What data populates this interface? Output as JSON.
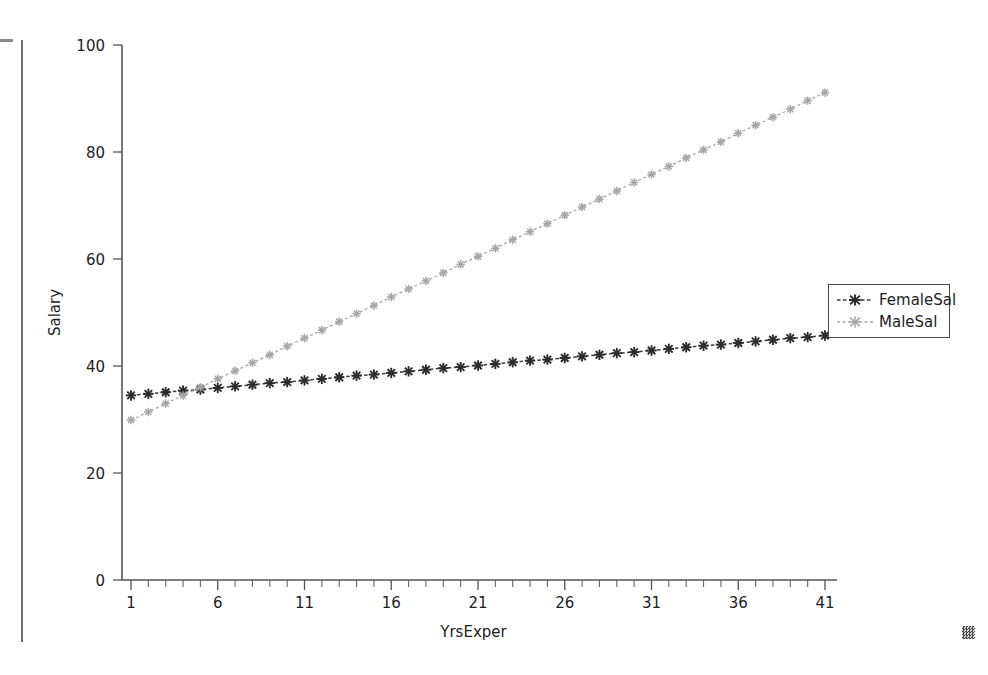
{
  "artifacts": {
    "left_rule": "vertical-scan-line",
    "top_dash": "scan-dash",
    "corner_mark": "scan-speck"
  },
  "chart_data": {
    "type": "line",
    "title": "",
    "xlabel": "YrsExper",
    "ylabel": "Salary",
    "xlim": [
      0,
      42
    ],
    "ylim": [
      0,
      100
    ],
    "xticks": [
      1,
      6,
      11,
      16,
      21,
      26,
      31,
      36,
      41
    ],
    "xtick_labels": [
      "1",
      "6",
      "11",
      "16",
      "21",
      "26",
      "31",
      "36",
      "41"
    ],
    "yticks": [
      0,
      20,
      40,
      60,
      80,
      100
    ],
    "ytick_labels": [
      "0",
      "20",
      "40",
      "60",
      "80",
      "100"
    ],
    "x_minor_step": 1,
    "grid": false,
    "legend_position": "right-center",
    "x": [
      1,
      2,
      3,
      4,
      5,
      6,
      7,
      8,
      9,
      10,
      11,
      12,
      13,
      14,
      15,
      16,
      17,
      18,
      19,
      20,
      21,
      22,
      23,
      24,
      25,
      26,
      27,
      28,
      29,
      30,
      31,
      32,
      33,
      34,
      35,
      36,
      37,
      38,
      39,
      40,
      41
    ],
    "series": [
      {
        "name": "FemaleSal",
        "color": "#2b2b2b",
        "marker": "asterisk",
        "linestyle": "dashed",
        "values": [
          34.5,
          34.8,
          35.1,
          35.4,
          35.6,
          35.9,
          36.2,
          36.5,
          36.8,
          37.0,
          37.3,
          37.6,
          37.9,
          38.2,
          38.4,
          38.7,
          39.0,
          39.3,
          39.6,
          39.8,
          40.1,
          40.4,
          40.7,
          41.0,
          41.2,
          41.5,
          41.8,
          42.1,
          42.4,
          42.6,
          42.9,
          43.2,
          43.5,
          43.8,
          44.0,
          44.3,
          44.6,
          44.9,
          45.2,
          45.4,
          45.7
        ]
      },
      {
        "name": "MaleSal",
        "color": "#a5a5a5",
        "marker": "asterisk",
        "linestyle": "dashed",
        "values": [
          29.9,
          31.4,
          33.0,
          34.5,
          36.0,
          37.6,
          39.1,
          40.6,
          42.1,
          43.7,
          45.2,
          46.7,
          48.3,
          49.8,
          51.3,
          52.9,
          54.4,
          55.9,
          57.4,
          59.0,
          60.5,
          62.0,
          63.6,
          65.1,
          66.6,
          68.2,
          69.7,
          71.2,
          72.7,
          74.3,
          75.8,
          77.3,
          78.9,
          80.4,
          81.9,
          83.5,
          85.0,
          86.5,
          88.0,
          89.6,
          91.1
        ]
      }
    ]
  }
}
